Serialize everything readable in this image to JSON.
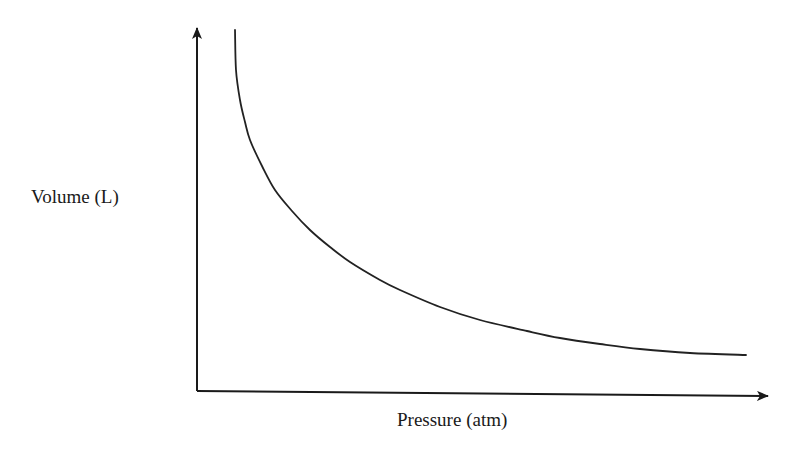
{
  "chart_data": {
    "type": "line",
    "title": "",
    "xlabel": "Pressure (atm)",
    "ylabel": "Volume (L)",
    "grid": false,
    "legend": null,
    "axes_ticks": "none",
    "series": [
      {
        "name": "Volume vs Pressure",
        "shape": "hyperbola (V = k / P)",
        "color": "#222222",
        "points_px": [
          [
            235,
            30
          ],
          [
            236,
            70
          ],
          [
            240,
            100
          ],
          [
            245,
            122
          ],
          [
            250,
            140
          ],
          [
            262,
            166
          ],
          [
            275,
            190
          ],
          [
            292,
            211
          ],
          [
            310,
            230
          ],
          [
            330,
            247
          ],
          [
            350,
            262
          ],
          [
            380,
            280
          ],
          [
            400,
            290
          ],
          [
            440,
            307
          ],
          [
            480,
            320
          ],
          [
            527,
            331
          ],
          [
            560,
            338
          ],
          [
            600,
            344
          ],
          [
            640,
            349
          ],
          [
            690,
            353
          ],
          [
            746,
            355
          ]
        ]
      }
    ]
  },
  "axes": {
    "color": "#1a1a1a",
    "y_axis": {
      "x": 197,
      "y_top": 28,
      "y_bottom": 391
    },
    "x_axis": {
      "x_left": 197,
      "x_right": 768,
      "y_left": 391,
      "y_right": 396
    }
  },
  "labels": {
    "y": "Volume (L)",
    "x": "Pressure (atm)"
  }
}
